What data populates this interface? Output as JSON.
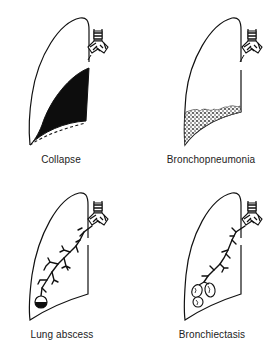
{
  "figure": {
    "panels": [
      {
        "id": "collapse",
        "label": "Collapse",
        "position": "top-left",
        "finding": "black collapsed wedge with dashed normal lung base outline"
      },
      {
        "id": "bronchopneumonia",
        "label": "Bronchopneumonia",
        "position": "top-right",
        "finding": "stippled patchy consolidation at lung base"
      },
      {
        "id": "lung-abscess",
        "label": "Lung abscess",
        "position": "bottom-left",
        "finding": "bronchial tree ending in round cavity with fluid level"
      },
      {
        "id": "bronchiectasis",
        "label": "Bronchiectasis",
        "position": "bottom-right",
        "finding": "bronchial tree ending in dilated saccular bronchi"
      }
    ],
    "colors": {
      "ink": "#111111",
      "background": "#ffffff",
      "label": "#222222"
    }
  }
}
